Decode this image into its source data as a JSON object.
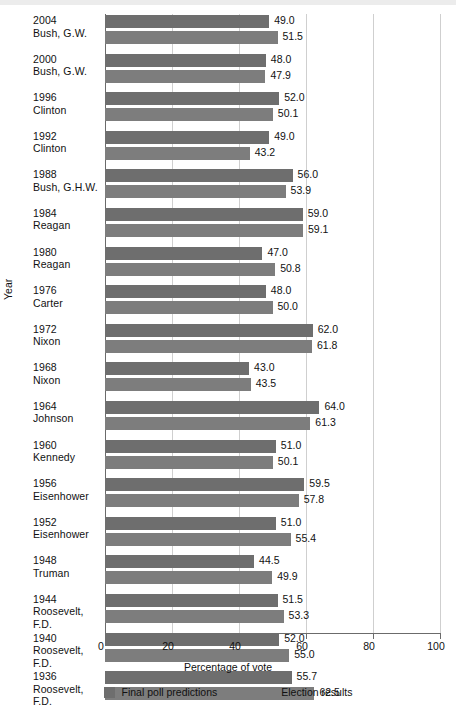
{
  "chart_data": {
    "type": "bar",
    "orientation": "horizontal",
    "title": "",
    "xlabel": "Percentage of vote",
    "ylabel": "Year",
    "xlim": [
      0,
      100
    ],
    "xticks": [
      0,
      20,
      40,
      60,
      80,
      100
    ],
    "grid": true,
    "legend_position": "bottom",
    "categories": [
      "2004 Bush, G.W.",
      "2000 Bush, G.W.",
      "1996 Clinton",
      "1992 Clinton",
      "1988 Bush, G.H.W.",
      "1984 Reagan",
      "1980 Reagan",
      "1976 Carter",
      "1972 Nixon",
      "1968 Nixon",
      "1964 Johnson",
      "1960 Kennedy",
      "1956 Eisenhower",
      "1952 Eisenhower",
      "1948 Truman",
      "1944 Roosevelt, F.D.",
      "1940 Roosevelt, F.D.",
      "1936 Roosevelt, F.D."
    ],
    "series": [
      {
        "name": "Final poll predictions",
        "color": "#6e6e6e",
        "values": [
          49.0,
          48.0,
          52.0,
          49.0,
          56.0,
          59.0,
          47.0,
          48.0,
          62.0,
          43.0,
          64.0,
          51.0,
          59.5,
          51.0,
          44.5,
          51.5,
          52.0,
          55.7
        ]
      },
      {
        "name": "Election results",
        "color": "#7d7d7d",
        "values": [
          51.5,
          47.9,
          50.1,
          43.2,
          53.9,
          59.1,
          50.8,
          50.0,
          61.8,
          43.5,
          61.3,
          50.1,
          57.8,
          55.4,
          49.9,
          53.3,
          55.0,
          62.5
        ]
      }
    ]
  },
  "rows": [
    {
      "year": "2004",
      "name": "Bush, G.W.",
      "poll": "49.0",
      "result": "51.5",
      "poll_v": 49.0,
      "result_v": 51.5
    },
    {
      "year": "2000",
      "name": "Bush, G.W.",
      "poll": "48.0",
      "result": "47.9",
      "poll_v": 48.0,
      "result_v": 47.9
    },
    {
      "year": "1996",
      "name": "Clinton",
      "poll": "52.0",
      "result": "50.1",
      "poll_v": 52.0,
      "result_v": 50.1
    },
    {
      "year": "1992",
      "name": "Clinton",
      "poll": "49.0",
      "result": "43.2",
      "poll_v": 49.0,
      "result_v": 43.2
    },
    {
      "year": "1988",
      "name": "Bush, G.H.W.",
      "poll": "56.0",
      "result": "53.9",
      "poll_v": 56.0,
      "result_v": 53.9
    },
    {
      "year": "1984",
      "name": "Reagan",
      "poll": "59.0",
      "result": "59.1",
      "poll_v": 59.0,
      "result_v": 59.1
    },
    {
      "year": "1980",
      "name": "Reagan",
      "poll": "47.0",
      "result": "50.8",
      "poll_v": 47.0,
      "result_v": 50.8
    },
    {
      "year": "1976",
      "name": "Carter",
      "poll": "48.0",
      "result": "50.0",
      "poll_v": 48.0,
      "result_v": 50.0
    },
    {
      "year": "1972",
      "name": "Nixon",
      "poll": "62.0",
      "result": "61.8",
      "poll_v": 62.0,
      "result_v": 61.8
    },
    {
      "year": "1968",
      "name": "Nixon",
      "poll": "43.0",
      "result": "43.5",
      "poll_v": 43.0,
      "result_v": 43.5
    },
    {
      "year": "1964",
      "name": "Johnson",
      "poll": "64.0",
      "result": "61.3",
      "poll_v": 64.0,
      "result_v": 61.3
    },
    {
      "year": "1960",
      "name": "Kennedy",
      "poll": "51.0",
      "result": "50.1",
      "poll_v": 51.0,
      "result_v": 50.1
    },
    {
      "year": "1956",
      "name": "Eisenhower",
      "poll": "59.5",
      "result": "57.8",
      "poll_v": 59.5,
      "result_v": 57.8
    },
    {
      "year": "1952",
      "name": "Eisenhower",
      "poll": "51.0",
      "result": "55.4",
      "poll_v": 51.0,
      "result_v": 55.4
    },
    {
      "year": "1948",
      "name": "Truman",
      "poll": "44.5",
      "result": "49.9",
      "poll_v": 44.5,
      "result_v": 49.9
    },
    {
      "year": "1944",
      "name": "Roosevelt, F.D.",
      "poll": "51.5",
      "result": "53.3",
      "poll_v": 51.5,
      "result_v": 53.3
    },
    {
      "year": "1940",
      "name": "Roosevelt, F.D.",
      "poll": "52.0",
      "result": "55.0",
      "poll_v": 52.0,
      "result_v": 55.0
    },
    {
      "year": "1936",
      "name": "Roosevelt, F.D.",
      "poll": "55.7",
      "result": "62.5",
      "poll_v": 55.7,
      "result_v": 62.5
    }
  ],
  "axis": {
    "xlabel": "Percentage of vote",
    "ylabel": "Year",
    "xticks": [
      "0",
      "20",
      "40",
      "60",
      "80",
      "100"
    ]
  },
  "legend": {
    "items": [
      {
        "label": "Final poll predictions",
        "color": "#6e6e6e"
      },
      {
        "label": "Election results",
        "color": "#7d7d7d"
      }
    ]
  }
}
